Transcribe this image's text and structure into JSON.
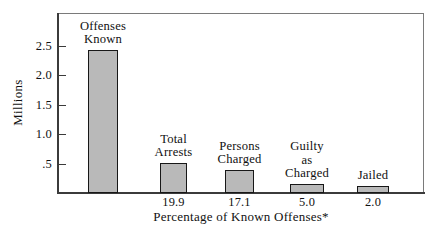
{
  "chart_data": {
    "type": "bar",
    "title": "",
    "subtitle": "",
    "xlabel": "Percentage of Known Offenses*",
    "ylabel": "Millions",
    "ylim": [
      0,
      2.75
    ],
    "grid": false,
    "legend": null,
    "y_ticks": [
      {
        "value": 2.5,
        "label": "2.5"
      },
      {
        "value": 2.0,
        "label": "2.0"
      },
      {
        "value": 1.5,
        "label": "1.5"
      },
      {
        "value": 1.0,
        "label": "1.0"
      },
      {
        "value": 0.5,
        "label": ".5"
      }
    ],
    "categories": [
      "Offenses Known",
      "Total Arrests",
      "Persons Charged",
      "Guilty as Charged",
      "Jailed"
    ],
    "values": [
      2.44,
      0.5,
      0.39,
      0.15,
      0.12
    ],
    "bars": [
      {
        "caption": "Offenses\nKnown",
        "value": 2.44,
        "percent_label": "",
        "x": 88,
        "width": 30,
        "top": 50
      },
      {
        "caption": "Total\nArrests",
        "value": 0.5,
        "percent_label": "19.9",
        "x": 160,
        "width": 27,
        "top": 163
      },
      {
        "caption": "Persons\nCharged",
        "value": 0.39,
        "percent_label": "17.1",
        "x": 225,
        "width": 29,
        "top": 170
      },
      {
        "caption": "Guilty\nas\nCharged",
        "value": 0.15,
        "percent_label": "5.0",
        "x": 290,
        "width": 34,
        "top": 184
      },
      {
        "caption": "Jailed",
        "value": 0.12,
        "percent_label": "2.0",
        "x": 357,
        "width": 32,
        "top": 186
      }
    ],
    "colors": {
      "bar_fill": "#b9b9b9",
      "bar_stroke": "#171717",
      "axis": "#3b3b3b",
      "frame": "#6a6a6a",
      "text": "#111111",
      "background": "#ffffff"
    }
  }
}
